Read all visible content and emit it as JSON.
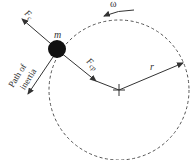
{
  "diagram": {
    "labels": {
      "mass": "m",
      "centrifugal_force": "F",
      "centrifugal_sub": "c",
      "centripetal_force": "F",
      "centripetal_sub": "cp",
      "radius": "r",
      "angular_velocity": "ω",
      "path_line1": "Path of",
      "path_line2": "inertia"
    },
    "colors": {
      "line": "#444444",
      "mass": "#111111",
      "background": "#ffffff"
    }
  }
}
